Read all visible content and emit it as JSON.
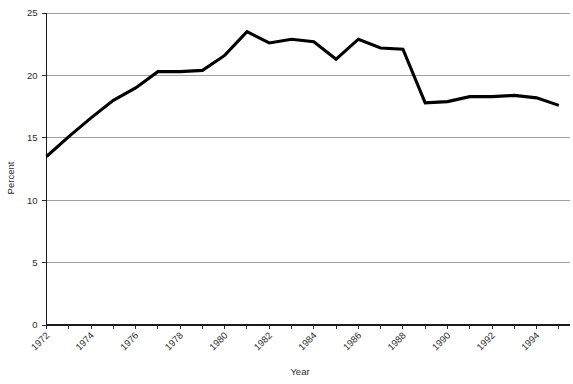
{
  "chart_data": {
    "type": "line",
    "title": "",
    "xlabel": "Year",
    "ylabel": "Percent",
    "xlim": [
      1972,
      1995.5
    ],
    "ylim": [
      0,
      25
    ],
    "grid": true,
    "legend": false,
    "y_ticks": [
      0,
      5,
      10,
      15,
      20,
      25
    ],
    "y_tick_labels": [
      "0",
      "5",
      "10",
      "15",
      "20",
      "25"
    ],
    "x_ticks": [
      1972,
      1974,
      1976,
      1978,
      1980,
      1982,
      1984,
      1986,
      1988,
      1990,
      1992,
      1994
    ],
    "x_tick_labels": [
      "1972",
      "1974",
      "1976",
      "1978",
      "1980",
      "1982",
      "1984",
      "1986",
      "1988",
      "1990",
      "1992",
      "1994"
    ],
    "x_minor_ticks": [
      1973,
      1975,
      1977,
      1979,
      1981,
      1983,
      1985,
      1987,
      1989,
      1991,
      1993,
      1995
    ],
    "line_color": "#000000",
    "grid_color": "#8a8a8a",
    "x": [
      1972,
      1973,
      1974,
      1975,
      1976,
      1977,
      1978,
      1979,
      1980,
      1981,
      1982,
      1983,
      1984,
      1985,
      1986,
      1987,
      1988,
      1989,
      1990,
      1991,
      1992,
      1993,
      1994,
      1995
    ],
    "values": [
      13.5,
      15.1,
      16.6,
      18.0,
      19.0,
      20.3,
      20.3,
      20.4,
      21.6,
      23.5,
      22.6,
      22.9,
      22.7,
      21.3,
      22.9,
      22.2,
      22.1,
      17.8,
      17.9,
      18.3,
      18.3,
      18.4,
      18.2,
      17.6
    ],
    "series": [
      {
        "name": "Percent",
        "values": [
          13.5,
          15.1,
          16.6,
          18.0,
          19.0,
          20.3,
          20.3,
          20.4,
          21.6,
          23.5,
          22.6,
          22.9,
          22.7,
          21.3,
          22.9,
          22.2,
          22.1,
          17.8,
          17.9,
          18.3,
          18.3,
          18.4,
          18.2,
          17.6
        ]
      }
    ]
  }
}
